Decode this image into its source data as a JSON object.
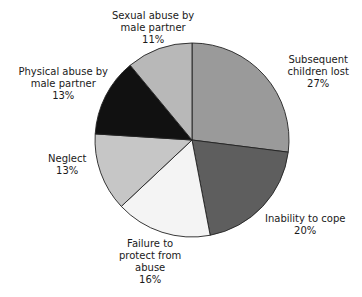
{
  "chart_data": {
    "type": "pie",
    "title": "",
    "start_angle_deg": 0,
    "direction": "clockwise",
    "center": [
      192,
      140
    ],
    "radius": 97,
    "slices": [
      {
        "label": "Subsequent children lost",
        "value": 27,
        "pct_text": "27%",
        "color": "#9a9a9a",
        "label_lines": [
          "Subsequent",
          "children lost",
          "27%"
        ],
        "label_pos": [
          318,
          72
        ]
      },
      {
        "label": "Inability to cope",
        "value": 20,
        "pct_text": "20%",
        "color": "#5e5e5e",
        "label_lines": [
          "Inability to cope",
          "20%"
        ],
        "label_pos": [
          305,
          225
        ]
      },
      {
        "label": "Failure to protect from abuse",
        "value": 16,
        "pct_text": "16%",
        "color": "#f4f4f4",
        "label_lines": [
          "Failure to",
          "protect from",
          "abuse",
          "16%"
        ],
        "label_pos": [
          150,
          262
        ]
      },
      {
        "label": "Neglect",
        "value": 13,
        "pct_text": "13%",
        "color": "#c6c6c6",
        "label_lines": [
          "Neglect",
          "13%"
        ],
        "label_pos": [
          67,
          165
        ]
      },
      {
        "label": "Physical abuse by male partner",
        "value": 13,
        "pct_text": "13%",
        "color": "#111111",
        "label_lines": [
          "Physical abuse by",
          "male partner",
          "13%"
        ],
        "label_pos": [
          63,
          84
        ]
      },
      {
        "label": "Sexual abuse by male partner",
        "value": 11,
        "pct_text": "11%",
        "color": "#b8b8b8",
        "label_lines": [
          "Sexual abuse by",
          "male partner",
          "11%"
        ],
        "label_pos": [
          153,
          28
        ]
      }
    ],
    "legend": "none (direct labels)"
  }
}
